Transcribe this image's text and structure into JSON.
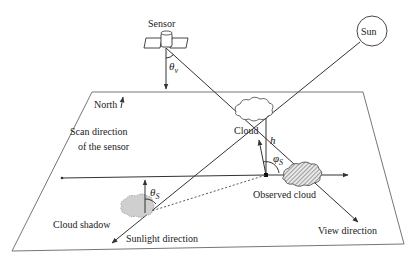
{
  "diagram": {
    "labels": {
      "sensor": "Sensor",
      "sun": "Sun",
      "north": "North",
      "theta_v": "θ",
      "theta_v_sub": "v",
      "cloud": "Cloud",
      "h": "h",
      "phi_s": "φ",
      "phi_s_sub": "S",
      "theta_s": "θ",
      "theta_s_sub": "S",
      "scan_line1": "Scan direction",
      "scan_line2": "of the sensor",
      "observed_cloud": "Observed cloud",
      "cloud_shadow": "Cloud shadow",
      "sunlight_direction": "Sunlight direction",
      "view_direction": "View direction"
    },
    "colors": {
      "line": "#333333",
      "plane": "#777777",
      "cloud_fill": "#ffffff",
      "shadow_fill": "#cfcfcf",
      "observed_hatch": "#555555"
    }
  }
}
